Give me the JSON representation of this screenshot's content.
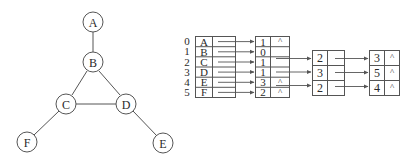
{
  "graph": {
    "vertices": [
      {
        "label": "A",
        "x": 93,
        "y": 22
      },
      {
        "label": "B",
        "x": 93,
        "y": 62
      },
      {
        "label": "C",
        "x": 66,
        "y": 104
      },
      {
        "label": "D",
        "x": 126,
        "y": 104
      },
      {
        "label": "E",
        "x": 163,
        "y": 143
      },
      {
        "label": "F",
        "x": 27,
        "y": 142
      }
    ],
    "edges": [
      [
        "A",
        "B"
      ],
      [
        "B",
        "C"
      ],
      [
        "B",
        "D"
      ],
      [
        "C",
        "D"
      ],
      [
        "C",
        "F"
      ],
      [
        "D",
        "E"
      ]
    ]
  },
  "adjacency_list": {
    "indices": [
      "0",
      "1",
      "2",
      "3",
      "4",
      "5"
    ],
    "vertices": [
      "A",
      "B",
      "C",
      "D",
      "E",
      "F"
    ],
    "null_symbol": "^",
    "lists": [
      [
        "1"
      ],
      [
        "0",
        "2",
        "3"
      ],
      [
        "1",
        "3",
        "5"
      ],
      [
        "1",
        "2",
        "4"
      ],
      [
        "3"
      ],
      [
        "2"
      ]
    ]
  }
}
